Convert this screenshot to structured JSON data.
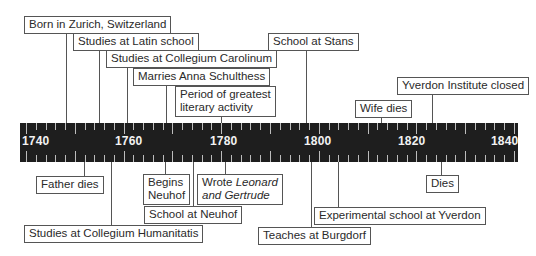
{
  "timeline": {
    "axis": {
      "start_year": 1740,
      "end_year": 1840,
      "labels": [
        "1740",
        "1760",
        "1780",
        "1800",
        "1820",
        "1840"
      ],
      "bar_color": "#1e1e1e",
      "tick_color": "#bdbdbd"
    },
    "events_above": [
      {
        "label": "Born in Zurich, Switzerland",
        "year": 1746
      },
      {
        "label": "Studies at Latin school",
        "year": 1754
      },
      {
        "label": "Studies at Collegium Carolinum",
        "year": 1761
      },
      {
        "label": "Marries Anna Schulthess",
        "year": 1769
      },
      {
        "label_line1": "Period of greatest",
        "label_line2": "literary activity",
        "year": 1780
      },
      {
        "label": "School at Stans",
        "year": 1798
      },
      {
        "label": "Wife dies",
        "year": 1815
      },
      {
        "label": "Yverdon Institute closed",
        "year": 1825
      }
    ],
    "events_below": [
      {
        "label": "Father dies",
        "year": 1751
      },
      {
        "label": "Studies at Collegium Humanitatis",
        "year": 1757
      },
      {
        "label_line1": "Begins",
        "label_line2": "Neuhof",
        "year": 1769
      },
      {
        "label": "School at Neuhof",
        "year": 1774
      },
      {
        "label_prefix": "Wrote ",
        "label_italic_1": "Leonard",
        "label_italic_2": "and Gertrude",
        "year": 1781
      },
      {
        "label": "Teaches at Burgdorf",
        "year": 1799
      },
      {
        "label": "Experimental school at Yverdon",
        "year": 1805
      },
      {
        "label": "Dies",
        "year": 1827
      }
    ]
  }
}
